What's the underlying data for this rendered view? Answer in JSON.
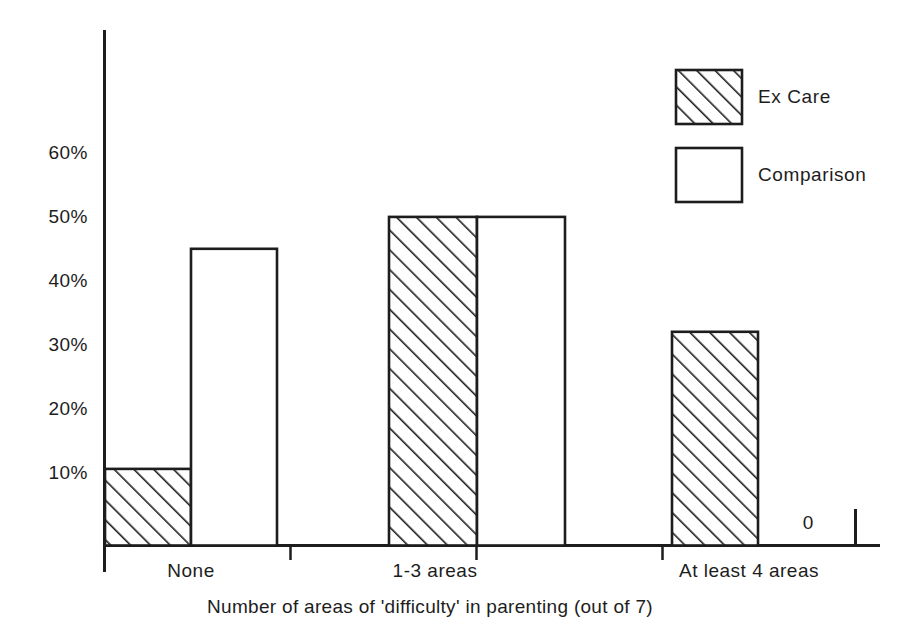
{
  "chart_data": {
    "type": "bar",
    "title": "",
    "subtitle": "",
    "xlabel": "Number of areas of 'difficulty' in parenting (out of 7)",
    "ylabel": "",
    "categories": [
      "None",
      "1-3 areas",
      "At least 4 areas"
    ],
    "series": [
      {
        "name": "Ex Care",
        "values": [
          12,
          51.5,
          33.5
        ],
        "fill": "hatched"
      },
      {
        "name": "Comparison",
        "values": [
          46.5,
          51.5,
          0
        ],
        "fill": "white"
      }
    ],
    "ylim": [
      0,
      68
    ],
    "ytick_values": [
      10,
      20,
      30,
      40,
      50,
      60
    ],
    "ytick_labels": [
      "10%",
      "20%",
      "30%",
      "40%",
      "50%",
      "60%"
    ],
    "grid": false,
    "legend_position": "top-right",
    "annotations": [
      {
        "text": "0",
        "series": "Comparison",
        "category": "At least 4 areas"
      }
    ],
    "colors": {
      "axis": "#1d1d1d",
      "bar_outline": "#1d1d1d",
      "bar_fill": "#ffffff",
      "hatch": "#1d1d1d",
      "background": "#ffffff"
    }
  },
  "legend": {
    "items": [
      {
        "label": "Ex Care",
        "swatch": "hatched-swatch"
      },
      {
        "label": "Comparison",
        "swatch": "plain-swatch"
      }
    ]
  },
  "axes": {
    "y_ticks": [
      {
        "label": "60%",
        "value": 60
      },
      {
        "label": "50%",
        "value": 50
      },
      {
        "label": "40%",
        "value": 40
      },
      {
        "label": "30%",
        "value": 30
      },
      {
        "label": "20%",
        "value": 20
      },
      {
        "label": "10%",
        "value": 10
      }
    ],
    "x_ticks": [
      {
        "label": "None"
      },
      {
        "label": "1-3 areas"
      },
      {
        "label": "At least 4 areas"
      }
    ],
    "x_title": "Number of areas of 'difficulty' in parenting (out of 7)"
  },
  "annotation": {
    "zero_value": "0"
  }
}
